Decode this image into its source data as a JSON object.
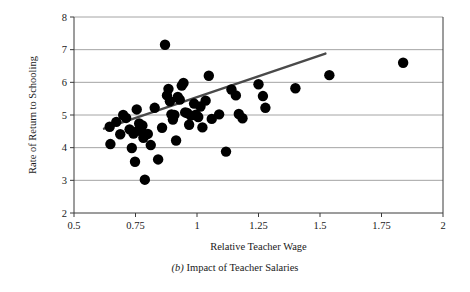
{
  "figure": {
    "caption_label": "(b)",
    "caption_text": "Impact of Teacher Salaries"
  },
  "chart_data": {
    "type": "scatter",
    "title": "",
    "xlabel": "Relative Teacher Wage",
    "ylabel": "Rate of Return to Schooling",
    "xlim": [
      0.5,
      2
    ],
    "ylim": [
      2,
      8
    ],
    "xticks": [
      0.5,
      0.75,
      1,
      1.25,
      1.5,
      1.75,
      2
    ],
    "xticklabels": [
      "0.5",
      "0.75",
      "1",
      "1.25",
      "1.5",
      "1.75",
      "2"
    ],
    "yticks": [
      2,
      3,
      4,
      5,
      6,
      7,
      8
    ],
    "yticklabels": [
      "2",
      "3",
      "4",
      "5",
      "6",
      "7",
      "8"
    ],
    "grid": "horizontal",
    "legend": "none",
    "marker": "filled-circle",
    "marker_color": "#000000",
    "marker_size": 5.2,
    "points": [
      [
        0.645,
        4.64
      ],
      [
        0.648,
        4.11
      ],
      [
        0.672,
        4.79
      ],
      [
        0.688,
        4.41
      ],
      [
        0.7,
        5.0
      ],
      [
        0.712,
        4.91
      ],
      [
        0.726,
        4.56
      ],
      [
        0.735,
        3.99
      ],
      [
        0.742,
        4.43
      ],
      [
        0.748,
        3.57
      ],
      [
        0.755,
        5.17
      ],
      [
        0.76,
        4.52
      ],
      [
        0.765,
        4.74
      ],
      [
        0.772,
        4.55
      ],
      [
        0.778,
        4.68
      ],
      [
        0.782,
        4.3
      ],
      [
        0.788,
        3.02
      ],
      [
        0.8,
        4.42
      ],
      [
        0.812,
        4.08
      ],
      [
        0.828,
        5.22
      ],
      [
        0.842,
        3.64
      ],
      [
        0.858,
        4.61
      ],
      [
        0.87,
        7.15
      ],
      [
        0.878,
        5.6
      ],
      [
        0.884,
        5.8
      ],
      [
        0.89,
        5.42
      ],
      [
        0.896,
        5.02
      ],
      [
        0.902,
        4.86
      ],
      [
        0.908,
        5.0
      ],
      [
        0.915,
        4.22
      ],
      [
        0.922,
        5.55
      ],
      [
        0.93,
        5.47
      ],
      [
        0.938,
        5.9
      ],
      [
        0.945,
        5.98
      ],
      [
        0.952,
        5.08
      ],
      [
        0.96,
        5.06
      ],
      [
        0.968,
        4.7
      ],
      [
        0.975,
        4.98
      ],
      [
        0.988,
        5.35
      ],
      [
        0.996,
        5.01
      ],
      [
        1.005,
        4.94
      ],
      [
        1.014,
        5.26
      ],
      [
        1.022,
        4.62
      ],
      [
        1.035,
        5.44
      ],
      [
        1.048,
        6.2
      ],
      [
        1.06,
        4.88
      ],
      [
        1.09,
        5.02
      ],
      [
        1.118,
        3.88
      ],
      [
        1.14,
        5.78
      ],
      [
        1.158,
        5.6
      ],
      [
        1.17,
        5.03
      ],
      [
        1.185,
        4.9
      ],
      [
        1.25,
        5.94
      ],
      [
        1.268,
        5.58
      ],
      [
        1.278,
        5.22
      ],
      [
        1.4,
        5.82
      ],
      [
        1.538,
        6.22
      ],
      [
        1.838,
        6.6
      ]
    ],
    "trend_line": {
      "x_start": 0.622,
      "y_start": 4.58,
      "x_end": 1.522,
      "y_end": 6.88,
      "color": "#4a4a4a"
    }
  }
}
